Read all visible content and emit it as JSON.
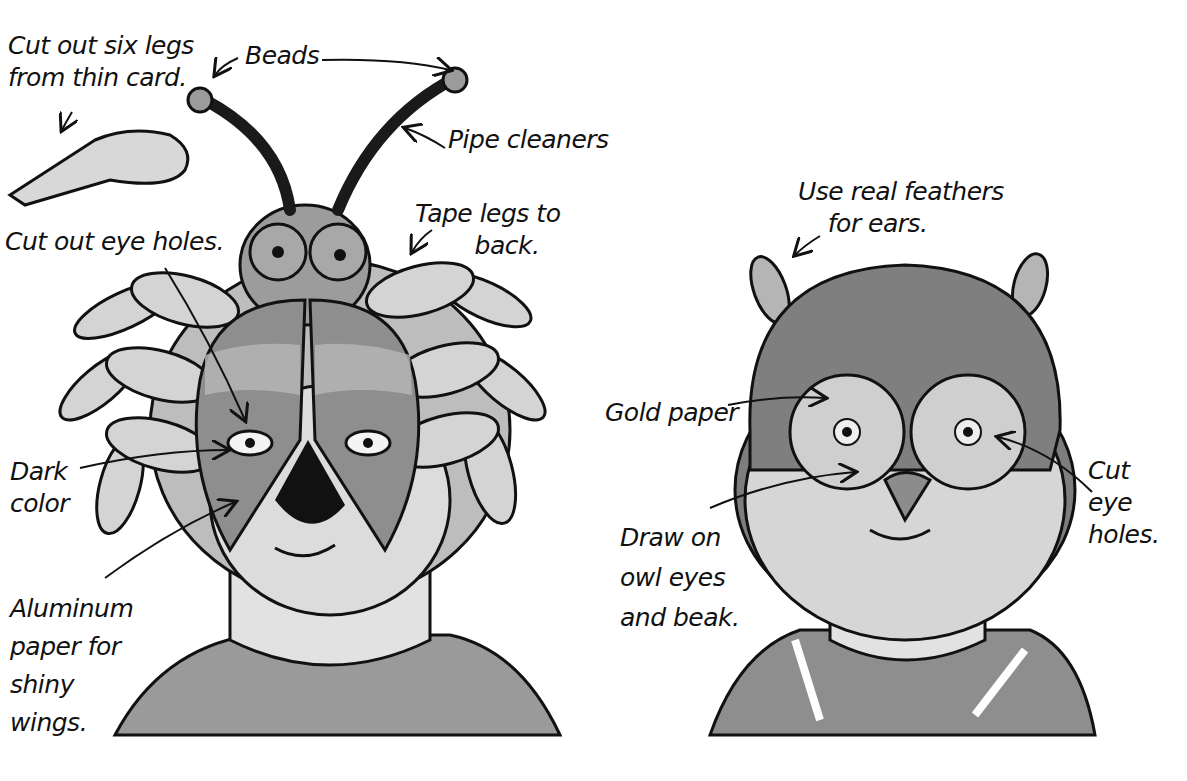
{
  "beetle_mask": {
    "labels": {
      "legs": "Cut out six legs\nfrom thin card.",
      "beads": "Beads",
      "pipe_cleaners": "Pipe cleaners",
      "tape": "Tape legs to\n        back.",
      "eye_holes": "Cut out eye holes.",
      "dark": "Dark\ncolor",
      "aluminum": "Aluminum\npaper for\nshiny\nwings."
    }
  },
  "owl_mask": {
    "labels": {
      "feathers": "Use real feathers\n    for ears.",
      "gold": "Gold paper",
      "cut_eyes": "Cut\neye\nholes.",
      "draw": "Draw on\nowl eyes\nand beak."
    }
  },
  "colors": {
    "ink": "#111111",
    "mid_gray": "#8a8a8a",
    "light_gray": "#cfcfcf",
    "skin": "#d9d9d9",
    "dark": "#222222"
  }
}
